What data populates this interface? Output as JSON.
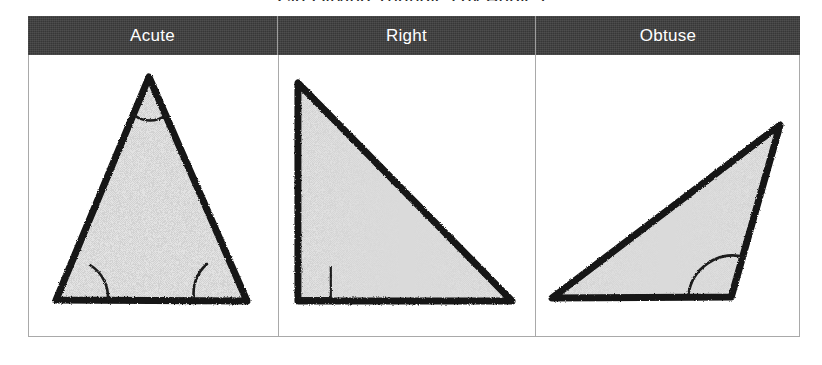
{
  "figure": {
    "title": "Classifying Triangles by Angles",
    "title_clipped": true
  },
  "table": {
    "columns": [
      {
        "key": "acute",
        "header_label": "Acute",
        "figure_name": "acute-triangle",
        "description": "Hand-drawn acute triangle with all three interior angles marked by arcs",
        "angle_markers": 3,
        "marker_type": "arc"
      },
      {
        "key": "right",
        "header_label": "Right",
        "figure_name": "right-triangle",
        "description": "Hand-drawn right triangle with a square marker at the bottom-left vertex",
        "angle_markers": 1,
        "marker_type": "square"
      },
      {
        "key": "obtuse",
        "header_label": "Obtuse",
        "figure_name": "obtuse-triangle",
        "description": "Hand-drawn obtuse triangle with an arc marking the obtuse angle at the bottom-right vertex",
        "angle_markers": 1,
        "marker_type": "arc"
      }
    ]
  },
  "colors": {
    "header_background": "#3d3d3d",
    "header_text": "#ffffff",
    "table_border": "#a9a9a9",
    "triangle_fill": "#dcdcdc",
    "triangle_stroke": "#141414",
    "page_background": "#ffffff"
  }
}
